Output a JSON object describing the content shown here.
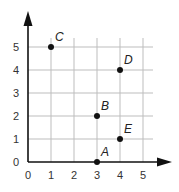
{
  "chart_data": {
    "type": "scatter",
    "title": "",
    "xlabel": "",
    "ylabel": "",
    "xlim": [
      0,
      5
    ],
    "ylim": [
      0,
      5
    ],
    "grid": true,
    "x_ticks": [
      "0",
      "1",
      "2",
      "3",
      "4",
      "5"
    ],
    "y_ticks": [
      "0",
      "1",
      "2",
      "3",
      "4",
      "5"
    ],
    "points": [
      {
        "label": "A",
        "x": 3,
        "y": 0
      },
      {
        "label": "B",
        "x": 3,
        "y": 2
      },
      {
        "label": "C",
        "x": 1,
        "y": 5
      },
      {
        "label": "D",
        "x": 4,
        "y": 4
      },
      {
        "label": "E",
        "x": 4,
        "y": 1
      }
    ]
  },
  "colors": {
    "axis": "#111111",
    "grid": "#bdbdbd",
    "point": "#111111"
  }
}
